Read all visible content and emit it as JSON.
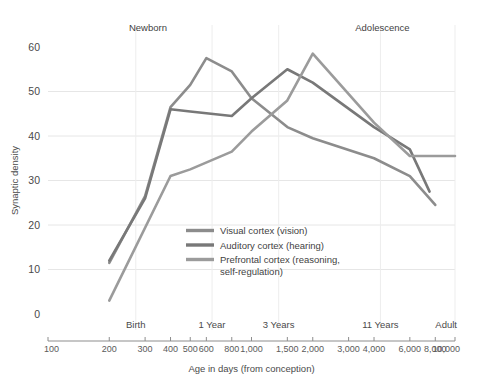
{
  "chart_data": {
    "type": "line",
    "title": "",
    "xlabel": "Age in days (from conception)",
    "ylabel": "Synaptic density",
    "xscale": "log",
    "xlim": [
      100,
      10000
    ],
    "ylim": [
      0,
      60
    ],
    "grid": true,
    "legend_position": "inside-center-left",
    "x_tick_labels": [
      "100",
      "200",
      "300",
      "400",
      "500",
      "600",
      "800",
      "1,000",
      "1,500",
      "2,000",
      "3,000",
      "4,000",
      "6,000",
      "8,000",
      "10,000"
    ],
    "x_tick_values": [
      100,
      200,
      300,
      400,
      500,
      600,
      800,
      1000,
      1500,
      2000,
      3000,
      4000,
      6000,
      8000,
      10000
    ],
    "y_tick_labels": [
      "0",
      "10",
      "20",
      "30",
      "40",
      "50",
      "60"
    ],
    "y_tick_values": [
      0,
      10,
      20,
      30,
      40,
      50,
      60
    ],
    "stage_markers": [
      {
        "label": "Birth",
        "value": 270
      },
      {
        "label": "1 Year",
        "value": 640
      },
      {
        "label": "3 Years",
        "value": 1360
      },
      {
        "label": "11 Years",
        "value": 4300
      },
      {
        "label": "Adult",
        "value": 10000
      }
    ],
    "annotations": [
      {
        "label": "Newborn",
        "x_value": 310,
        "y_value": 63
      },
      {
        "label": "Adolescence",
        "x_value": 4400,
        "y_value": 63
      }
    ],
    "series": [
      {
        "name": "Visual cortex (vision)",
        "color": "#8c8c8c",
        "x": [
          200,
          300,
          400,
          500,
          600,
          800,
          1000,
          1500,
          2000,
          4000,
          6000,
          8000
        ],
        "values": [
          11.5,
          26.5,
          46.5,
          51.5,
          57.5,
          54.5,
          48.5,
          42.0,
          39.5,
          35.0,
          31.0,
          24.5
        ]
      },
      {
        "name": "Auditory cortex (hearing)",
        "color": "#787878",
        "x": [
          200,
          300,
          400,
          500,
          800,
          1000,
          1500,
          2000,
          4000,
          6000,
          7500
        ],
        "values": [
          12.0,
          26.0,
          46.0,
          45.5,
          44.5,
          48.5,
          55.0,
          52.0,
          42.0,
          37.0,
          27.5
        ]
      },
      {
        "name": "Prefrontal cortex (reasoning, self-regulation)",
        "color": "#9b9b9b",
        "x": [
          200,
          400,
          500,
          800,
          1000,
          1500,
          2000,
          4000,
          6000,
          10000
        ],
        "values": [
          3.0,
          31.0,
          32.5,
          36.5,
          41.0,
          48.0,
          58.5,
          43.0,
          35.5,
          35.5
        ]
      }
    ]
  },
  "legend": {
    "items": [
      {
        "label": "Visual cortex (vision)"
      },
      {
        "label": "Auditory cortex (hearing)"
      },
      {
        "label": "Prefrontal cortex (reasoning,"
      },
      {
        "label": "self-regulation)"
      }
    ]
  }
}
